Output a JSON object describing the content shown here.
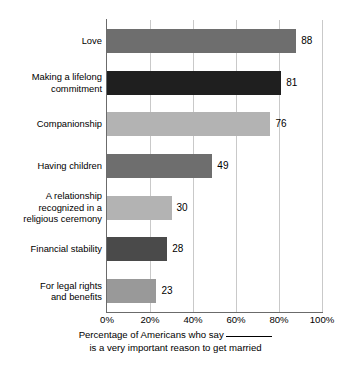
{
  "chart_data": {
    "type": "bar",
    "orientation": "horizontal",
    "title": "",
    "subtitle": "",
    "xlabel_line1": "Percentage of Americans who say",
    "xlabel_line2": "is a very important reason to get married",
    "ylabel": "",
    "categories": [
      "Love",
      "Making a lifelong\ncommitment",
      "Companionship",
      "Having children",
      "A relationship\nrecognized in a\nreligious ceremony",
      "Financial stability",
      "For legal rights\nand benefits"
    ],
    "values": [
      88,
      81,
      76,
      49,
      30,
      28,
      23
    ],
    "value_labels": [
      "88",
      "81",
      "76",
      "49",
      "30",
      "28",
      "23"
    ],
    "bar_colors": [
      "#6e6e6e",
      "#1f1f1f",
      "#b3b3b3",
      "#6e6e6e",
      "#b3b3b3",
      "#4a4a4a",
      "#999999"
    ],
    "xlim": [
      0,
      100
    ],
    "xticks": [
      0,
      20,
      40,
      60,
      80,
      100
    ],
    "xtick_labels": [
      "0%",
      "20%",
      "40%",
      "60%",
      "80%",
      "100%"
    ],
    "grid": true,
    "grid_axis": "x",
    "grid_color": "#c9c9c9",
    "axis_color": "#6b6b6b",
    "legend": false,
    "background": "#ffffff"
  }
}
